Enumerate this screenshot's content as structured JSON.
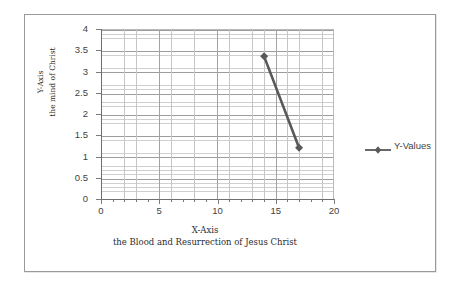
{
  "chart_data": {
    "type": "line",
    "title": "",
    "xlabel": "X-Axis",
    "xlabel_sub": "the Blood and Resurrection of Jesus Christ",
    "ylabel": "Y-Axis",
    "ylabel_sub": "the mind of Christ",
    "xlim": [
      0,
      20
    ],
    "ylim": [
      0,
      4
    ],
    "x_ticks": [
      0,
      5,
      10,
      15,
      20
    ],
    "x_tick_labels": [
      "0",
      "5",
      "10",
      "15",
      "20"
    ],
    "y_ticks": [
      0,
      0.5,
      1,
      1.5,
      2,
      2.5,
      3,
      3.5,
      4
    ],
    "y_tick_labels": [
      "0",
      "0.5",
      "1",
      "1.5",
      "2",
      "2.5",
      "3",
      "3.5",
      "4"
    ],
    "grid": true,
    "grid_minor": true,
    "legend_position": "right",
    "series": [
      {
        "name": "Y-Values",
        "color": "#595959",
        "marker": "diamond",
        "x": [
          14,
          17
        ],
        "y": [
          3.38,
          1.23
        ],
        "points": [
          {
            "x": 14,
            "y": 3.38
          },
          {
            "x": 17,
            "y": 1.23
          }
        ]
      }
    ]
  },
  "legend": {
    "entries": [
      {
        "label": "Y-Values",
        "color": "#595959",
        "marker": "diamond"
      }
    ]
  },
  "axes": {
    "x_title_line1": "X-Axis",
    "x_title_line2": "the Blood and Resurrection of Jesus Christ",
    "y_title_line1": "Y-Axis",
    "y_title_line2": "the mind of Christ"
  },
  "colors": {
    "series": "#595959",
    "frame_border": "#9a9a9a",
    "grid_major": "#9d9d9d",
    "grid_minor": "#cfcfcf",
    "axis_line": "#6f6f6f",
    "text": "#3f3f3f",
    "background": "#ffffff"
  }
}
